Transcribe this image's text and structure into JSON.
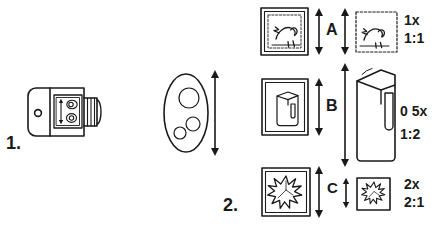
{
  "diagram": {
    "background_color": "#ffffff",
    "line_color": "#1a1a1a"
  },
  "steps": [
    {
      "id": "step-1",
      "label": "1."
    },
    {
      "id": "step-2",
      "label": "2."
    }
  ],
  "step1": {
    "device": {
      "name": "macro-adapter-body",
      "panel_icon": "up-down-arrow-and-lens-circles-icon",
      "port_icon": "round-port-icon",
      "thread_icon": "ribbed-thread-icon"
    },
    "subject": {
      "name": "oval-subject-with-circles",
      "dots_icon": "three-circles-icon",
      "size_arrow_icon": "vertical-double-arrow-icon"
    }
  },
  "rows": [
    {
      "id": "row-a",
      "letter": "A",
      "magnification": "1x",
      "ratio": "1:1",
      "subject_icon": "framed-bird-stamp-icon",
      "result_icon": "perforated-bird-stamp-icon",
      "subject_arrow_icon": "vertical-double-arrow-icon",
      "result_arrow_icon": "vertical-double-arrow-icon"
    },
    {
      "id": "row-b",
      "letter": "B",
      "magnification": "0 5x",
      "ratio": "1:2",
      "subject_icon": "framed-box-icon",
      "result_icon": "large-3d-box-icon",
      "subject_arrow_icon": "vertical-double-arrow-icon",
      "result_arrow_icon": "vertical-double-arrow-icon"
    },
    {
      "id": "row-c",
      "letter": "C",
      "magnification": "2x",
      "ratio": "2:1",
      "subject_icon": "framed-leaf-stamp-icon",
      "result_icon": "small-leaf-stamp-icon",
      "subject_arrow_icon": "vertical-double-arrow-icon",
      "result_arrow_icon": "vertical-double-arrow-icon"
    }
  ]
}
